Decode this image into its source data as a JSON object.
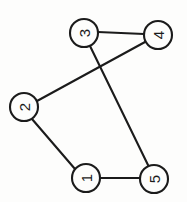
{
  "diagram": {
    "type": "undirected-graph",
    "title": "",
    "background_color": "#fdfdfc",
    "stroke_color": "#1b1b1b",
    "node_fill_color": "#fdfdfc",
    "label_rotation_degrees": -90,
    "node_radius": 14,
    "nodes": [
      {
        "id": "3",
        "label": "3",
        "cx": 84,
        "cy": 33
      },
      {
        "id": "4",
        "label": "4",
        "cx": 158,
        "cy": 35
      },
      {
        "id": "2",
        "label": "2",
        "cx": 24,
        "cy": 107
      },
      {
        "id": "1",
        "label": "1",
        "cx": 86,
        "cy": 178
      },
      {
        "id": "5",
        "label": "5",
        "cx": 154,
        "cy": 179
      }
    ],
    "edges": [
      {
        "id": "edge-3-4",
        "from": "3",
        "to": "4",
        "x1": 98,
        "y1": 32,
        "x2": 144,
        "y2": 34
      },
      {
        "id": "edge-3-5",
        "from": "3",
        "to": "5",
        "x1": 90,
        "y1": 46,
        "x2": 148,
        "y2": 165
      },
      {
        "id": "edge-2-4",
        "from": "2",
        "to": "4",
        "x1": 37,
        "y1": 101,
        "x2": 145,
        "y2": 42
      },
      {
        "id": "edge-2-1",
        "from": "2",
        "to": "1",
        "x1": 32,
        "y1": 119,
        "x2": 75,
        "y2": 169
      },
      {
        "id": "edge-1-5",
        "from": "1",
        "to": "5",
        "x1": 100,
        "y1": 178,
        "x2": 140,
        "y2": 178
      }
    ]
  }
}
